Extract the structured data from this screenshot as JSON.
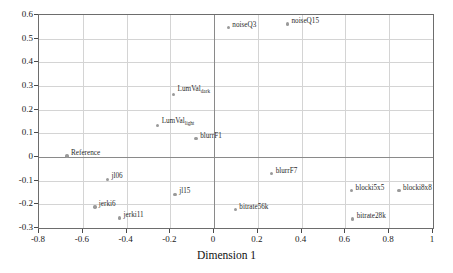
{
  "chart_data": {
    "type": "scatter",
    "title": "",
    "xlabel": "Dimension 1",
    "ylabel": "Dimension 2",
    "xlim": [
      -0.8,
      1.0
    ],
    "ylim": [
      -0.3,
      0.6
    ],
    "xticks": [
      "-0.8",
      "-0.6",
      "-0.4",
      "-0.2",
      "0",
      "0.2",
      "0.4",
      "0.6",
      "0.8",
      "1"
    ],
    "xtick_values": [
      -0.8,
      -0.6,
      -0.4,
      -0.2,
      0,
      0.2,
      0.4,
      0.6,
      0.8,
      1.0
    ],
    "yticks": [
      "0.6",
      "0.5",
      "0.4",
      "0.3",
      "0.2",
      "0.1",
      "0",
      "-0.1",
      "-0.2",
      "-0.3"
    ],
    "ytick_values": [
      0.6,
      0.5,
      0.4,
      0.3,
      0.2,
      0.1,
      0,
      -0.1,
      -0.2,
      -0.3
    ],
    "grid": true,
    "legend": "none",
    "marker_color": "#9a9a9a",
    "points": [
      {
        "label": "noiseQ3",
        "sub": "",
        "x": 0.065,
        "y": 0.547,
        "lx": 4,
        "ly": -7
      },
      {
        "label": "noiseQ15",
        "sub": "",
        "x": 0.335,
        "y": 0.562,
        "lx": 4,
        "ly": -7
      },
      {
        "label": "LumVal",
        "sub": "dark",
        "x": -0.185,
        "y": 0.265,
        "lx": 4,
        "ly": -9
      },
      {
        "label": "LumVal",
        "sub": "light",
        "x": -0.258,
        "y": 0.132,
        "lx": 4,
        "ly": -9
      },
      {
        "label": "blurrF1",
        "sub": "",
        "x": -0.082,
        "y": 0.078,
        "lx": 4,
        "ly": -7
      },
      {
        "label": "Reference",
        "sub": "",
        "x": -0.672,
        "y": 0.004,
        "lx": 4,
        "ly": -7
      },
      {
        "label": "jl06",
        "sub": "",
        "x": -0.487,
        "y": -0.095,
        "lx": 4,
        "ly": -7
      },
      {
        "label": "blurrF7",
        "sub": "",
        "x": 0.263,
        "y": -0.07,
        "lx": 4,
        "ly": -7
      },
      {
        "label": "blocki5x5",
        "sub": "",
        "x": 0.628,
        "y": -0.142,
        "lx": 4,
        "ly": -7
      },
      {
        "label": "blocki8x8",
        "sub": "",
        "x": 0.845,
        "y": -0.142,
        "lx": 4,
        "ly": -7
      },
      {
        "label": "jl15",
        "sub": "",
        "x": -0.178,
        "y": -0.158,
        "lx": 4,
        "ly": -7
      },
      {
        "label": "jerki6",
        "sub": "",
        "x": -0.545,
        "y": -0.212,
        "lx": 4,
        "ly": -7
      },
      {
        "label": "bitrate56k",
        "sub": "",
        "x": 0.097,
        "y": -0.223,
        "lx": 4,
        "ly": -7
      },
      {
        "label": "jerki11",
        "sub": "",
        "x": -0.432,
        "y": -0.258,
        "lx": 4,
        "ly": -7
      },
      {
        "label": "bitrate28k",
        "sub": "",
        "x": 0.633,
        "y": -0.262,
        "lx": 4,
        "ly": -7
      }
    ]
  }
}
